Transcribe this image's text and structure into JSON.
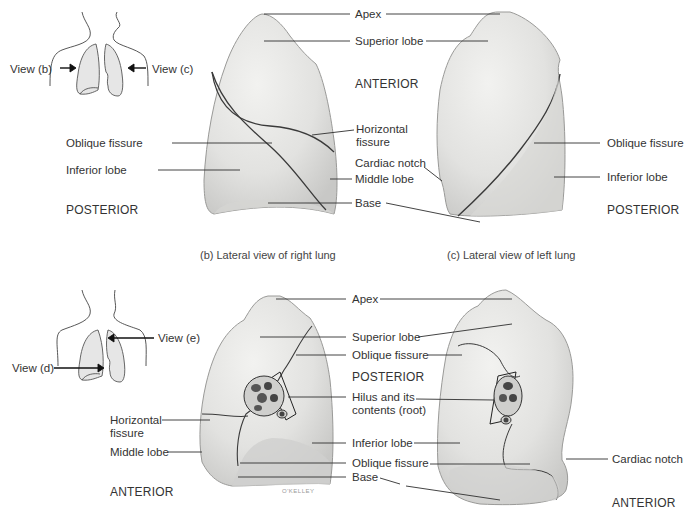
{
  "figure": {
    "panels": [
      {
        "id": "b",
        "caption": "(b) Lateral view of right lung",
        "orientation_left": "POSTERIOR",
        "orientation_right": "ANTERIOR",
        "labels": [
          "Apex",
          "Superior lobe",
          "Oblique fissure",
          "Horizontal fissure",
          "Inferior lobe",
          "Middle lobe",
          "Base"
        ]
      },
      {
        "id": "c",
        "caption": "(c) Lateral view of left lung",
        "orientation_right": "POSTERIOR",
        "labels": [
          "Apex",
          "Superior lobe",
          "Cardiac notch",
          "Oblique fissure",
          "Inferior lobe",
          "Base"
        ]
      },
      {
        "id": "d",
        "orientation_bottom_left": "ANTERIOR",
        "orientation_center": "POSTERIOR",
        "labels": [
          "Apex",
          "Superior lobe",
          "Oblique fissure",
          "Horizontal fissure",
          "Hilus and its contents (root)",
          "Middle lobe",
          "Inferior lobe",
          "Base"
        ]
      },
      {
        "id": "e",
        "orientation_bottom_right": "ANTERIOR",
        "labels": [
          "Apex",
          "Superior lobe",
          "Oblique fissure",
          "Hilus and its contents (root)",
          "Inferior lobe",
          "Cardiac notch",
          "Base"
        ]
      }
    ],
    "inset_top": {
      "view_left": "View (b)",
      "view_right": "View (c)"
    },
    "inset_bottom": {
      "view_upper": "View (e)",
      "view_lower": "View (d)"
    },
    "top": {
      "apex": "Apex",
      "superior_lobe": "Superior lobe",
      "anterior": "ANTERIOR",
      "oblique_fissure_left": "Oblique fissure",
      "horizontal_fissure_l1": "Horizontal",
      "horizontal_fissure_l2": "fissure",
      "inferior_lobe_left": "Inferior lobe",
      "cardiac_notch": "Cardiac notch",
      "middle_lobe": "Middle lobe",
      "base": "Base",
      "posterior_left": "POSTERIOR",
      "oblique_fissure_right": "Oblique fissure",
      "inferior_lobe_right": "Inferior lobe",
      "posterior_right": "POSTERIOR",
      "caption_b": "(b) Lateral view of right lung",
      "caption_c": "(c) Lateral view of left lung"
    },
    "bottom": {
      "apex": "Apex",
      "superior_lobe": "Superior lobe",
      "oblique_fissure_upper": "Oblique fissure",
      "posterior": "POSTERIOR",
      "hilus_l1": "Hilus and its",
      "hilus_l2": "contents (root)",
      "horizontal_fissure_l1": "Horizontal",
      "horizontal_fissure_l2": "fissure",
      "inferior_lobe": "Inferior lobe",
      "middle_lobe": "Middle lobe",
      "oblique_fissure_lower": "Oblique fissure",
      "cardiac_notch": "Cardiac notch",
      "base": "Base",
      "anterior_left": "ANTERIOR",
      "anterior_right": "ANTERIOR",
      "signature": "O'KELLEY"
    }
  },
  "colors": {
    "lung_fill": "#e6e6e4",
    "lung_shade": "#c9c9c7",
    "fissure": "#3a3a3a",
    "leader": "#2f2f2f",
    "inset_fill": "#e9e9e9",
    "background": "#ffffff"
  }
}
